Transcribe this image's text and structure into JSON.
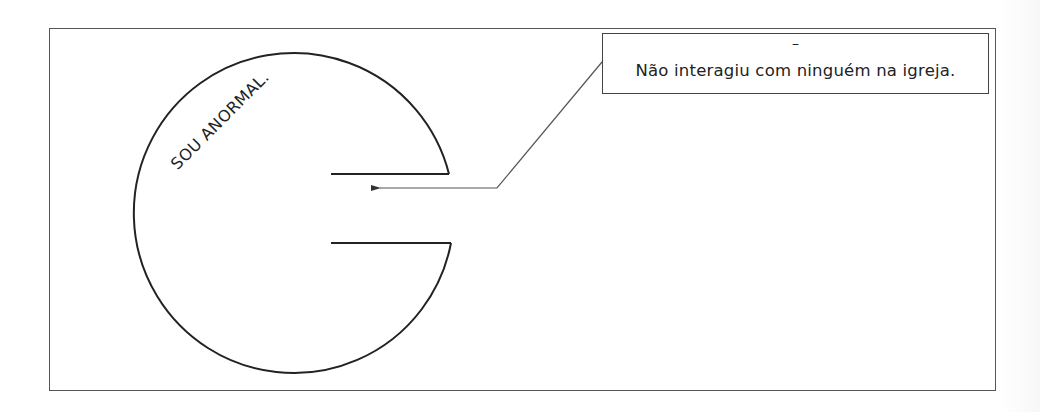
{
  "diagram": {
    "type": "speech-bubble-notch-circle",
    "circle_label": "SOU ANORMAL.",
    "callout": {
      "dash": "–",
      "text": "Não interagiu com ninguém na igreja."
    },
    "colors": {
      "stroke": "#222222",
      "frame": "#555555",
      "background": "#ffffff"
    }
  }
}
